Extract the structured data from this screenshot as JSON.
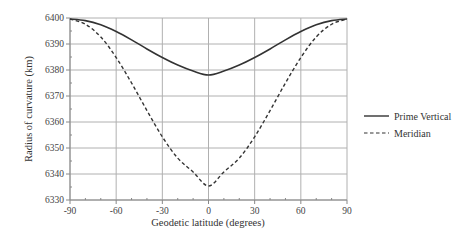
{
  "chart_data": {
    "type": "line",
    "title": "",
    "xlabel": "Geodetic latitude (degrees)",
    "ylabel": "Radius of curvature (km)",
    "xlim": [
      -90,
      90
    ],
    "ylim": [
      6330,
      6400
    ],
    "xticks": [
      -90,
      -60,
      -30,
      0,
      30,
      60,
      90
    ],
    "yticks": [
      6330,
      6340,
      6350,
      6360,
      6370,
      6380,
      6390,
      6400
    ],
    "grid": true,
    "legend_position": "right",
    "x": [
      -90,
      -80,
      -70,
      -60,
      -50,
      -40,
      -30,
      -20,
      -10,
      0,
      10,
      20,
      30,
      40,
      50,
      60,
      70,
      80,
      90
    ],
    "series": [
      {
        "name": "Prime Vertical",
        "style": "solid",
        "values": [
          6399.6,
          6399.0,
          6397.4,
          6394.8,
          6391.6,
          6388.1,
          6384.8,
          6381.9,
          6379.6,
          6378.1,
          6379.6,
          6381.9,
          6384.8,
          6388.1,
          6391.6,
          6394.8,
          6397.4,
          6399.0,
          6399.6
        ]
      },
      {
        "name": "Meridian",
        "style": "dashed",
        "values": [
          6399.6,
          6397.6,
          6392.7,
          6384.8,
          6375.0,
          6364.4,
          6354.3,
          6346.1,
          6340.8,
          6335.4,
          6340.8,
          6346.1,
          6354.3,
          6364.4,
          6375.0,
          6384.8,
          6392.7,
          6397.6,
          6399.6
        ]
      }
    ]
  },
  "legend": {
    "items": [
      {
        "label": "Prime Vertical",
        "style": "solid"
      },
      {
        "label": "Meridian",
        "style": "dashed"
      }
    ]
  },
  "colors": {
    "line": "#333333",
    "grid": "#b0b0b0",
    "axis": "#888888"
  }
}
